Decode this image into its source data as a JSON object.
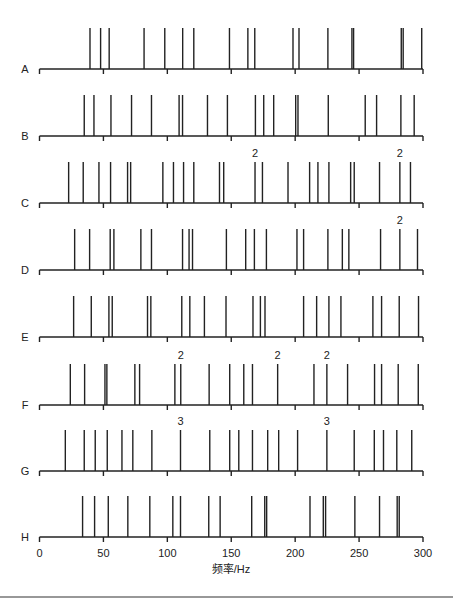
{
  "chart_data": {
    "type": "spike-raster",
    "title": "",
    "xlabel": "频率/Hz",
    "ylabel": "",
    "xlim": [
      0,
      300
    ],
    "xticks": [
      0,
      50,
      100,
      150,
      200,
      250,
      300
    ],
    "xtick_labels": [
      "0",
      "50",
      "100",
      "150",
      "200",
      "250",
      "300"
    ],
    "grid": false,
    "legend": null,
    "series": [
      {
        "name": "A",
        "values": [
          39.5,
          47.8,
          54.5,
          81.8,
          98,
          112,
          120.7,
          148.6,
          163,
          168.4,
          198.3,
          203,
          225.6,
          244.4,
          245.7,
          283,
          284.5,
          299
        ],
        "annotations": []
      },
      {
        "name": "B",
        "values": [
          35,
          42.6,
          55.9,
          72,
          87.6,
          109.2,
          111.9,
          131.4,
          147,
          168.9,
          175.4,
          183.2,
          200.4,
          202.2,
          225.9,
          254.8,
          263.7,
          282.7,
          293.1
        ],
        "annotations": []
      },
      {
        "name": "C",
        "values": [
          22.8,
          34.2,
          46.5,
          55.6,
          68.9,
          71.3,
          96.5,
          104.8,
          112.7,
          120.7,
          140.8,
          144.1,
          168.6,
          174.4,
          194.4,
          211.3,
          217.8,
          226.4,
          243.4,
          246.2,
          266,
          281.9,
          290.2
        ],
        "annotations": [
          {
            "x": 168.6,
            "label": "2"
          },
          {
            "x": 281.9,
            "label": "2"
          }
        ]
      },
      {
        "name": "D",
        "values": [
          27.5,
          39.2,
          55.3,
          58.2,
          79.3,
          87.6,
          111.9,
          117,
          119.7,
          146.2,
          161.3,
          168.1,
          177.5,
          201.4,
          206.6,
          225.6,
          236.9,
          242,
          266.8,
          281.9,
          295.7
        ],
        "annotations": [
          {
            "x": 281.9,
            "label": "2"
          }
        ]
      },
      {
        "name": "E",
        "values": [
          26.7,
          40.5,
          54.3,
          56.9,
          84.5,
          87.1,
          111.3,
          117.6,
          129,
          145.9,
          167,
          172.8,
          176.4,
          206.6,
          216.8,
          226.4,
          235.8,
          260.8,
          267.6,
          281.4,
          296.5
        ],
        "annotations": []
      },
      {
        "name": "F",
        "values": [
          24.1,
          35.3,
          51.2,
          52.7,
          74.6,
          78.3,
          105.9,
          110.5,
          132.7,
          148.8,
          159.8,
          166.6,
          186.3,
          214.7,
          224.8,
          241,
          262.1,
          267.6,
          280.6,
          296.3
        ],
        "annotations": [
          {
            "x": 110.5,
            "label": "2"
          },
          {
            "x": 186.3,
            "label": "2"
          },
          {
            "x": 224.8,
            "label": "2"
          }
        ]
      },
      {
        "name": "G",
        "values": [
          20.2,
          35,
          43.6,
          53,
          64.5,
          73,
          87.9,
          110.3,
          133.2,
          148.8,
          155.9,
          166.6,
          178.5,
          187.1,
          201.9,
          224.8,
          246.2,
          261.9,
          269.1,
          279.5,
          291.2
        ],
        "annotations": [
          {
            "x": 110.3,
            "label": "3"
          },
          {
            "x": 224.8,
            "label": "3"
          }
        ]
      },
      {
        "name": "H",
        "values": [
          33.7,
          43.1,
          53.8,
          69.1,
          86.3,
          104.3,
          110.3,
          132.4,
          141.3,
          166,
          176.2,
          177.7,
          211.6,
          222,
          223.8,
          246.7,
          266,
          279.8,
          281.4
        ],
        "annotations": []
      }
    ]
  },
  "layout": {
    "x0_px": 39.5,
    "x300_px": 423,
    "baselines_px": [
      69,
      136,
      203,
      270,
      337,
      405,
      471,
      537
    ],
    "spike_height_px": 41
  }
}
